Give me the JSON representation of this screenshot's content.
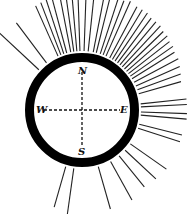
{
  "diagram": {
    "center": [
      82,
      110
    ],
    "ring_outer_r": 57,
    "ring_inner_r": 48,
    "ray_start_r": 59,
    "ray_color": "#222222",
    "ring_color": "#000000",
    "labels": {
      "north": "N",
      "south": "S",
      "east": "E",
      "west": "W"
    },
    "rays": [
      {
        "angle": -47,
        "len": 60
      },
      {
        "angle": -37,
        "len": 50
      },
      {
        "angle": -24,
        "len": 55
      },
      {
        "angle": -21,
        "len": 56
      },
      {
        "angle": -18,
        "len": 58
      },
      {
        "angle": -15,
        "len": 58
      },
      {
        "angle": -11,
        "len": 60
      },
      {
        "angle": -8,
        "len": 60
      },
      {
        "angle": -5,
        "len": 60
      },
      {
        "angle": -2,
        "len": 62
      },
      {
        "angle": 2,
        "len": 62
      },
      {
        "angle": 6,
        "len": 60
      },
      {
        "angle": 11,
        "len": 58
      },
      {
        "angle": 14,
        "len": 60
      },
      {
        "angle": 18,
        "len": 60
      },
      {
        "angle": 21,
        "len": 58
      },
      {
        "angle": 24,
        "len": 60
      },
      {
        "angle": 28,
        "len": 58
      },
      {
        "angle": 31,
        "len": 58
      },
      {
        "angle": 34,
        "len": 58
      },
      {
        "angle": 37,
        "len": 56
      },
      {
        "angle": 40,
        "len": 56
      },
      {
        "angle": 43,
        "len": 56
      },
      {
        "angle": 46,
        "len": 54
      },
      {
        "angle": 49,
        "len": 54
      },
      {
        "angle": 52,
        "len": 52
      },
      {
        "angle": 55,
        "len": 52
      },
      {
        "angle": 58,
        "len": 50
      },
      {
        "angle": 62,
        "len": 50
      },
      {
        "angle": 66,
        "len": 48
      },
      {
        "angle": 70,
        "len": 46
      },
      {
        "angle": 74,
        "len": 44
      },
      {
        "angle": 84,
        "len": 46
      },
      {
        "angle": 87,
        "len": 46
      },
      {
        "angle": 92,
        "len": 46
      },
      {
        "angle": 95,
        "len": 46
      },
      {
        "angle": 104,
        "len": 44
      },
      {
        "angle": 108,
        "len": 44
      },
      {
        "angle": 125,
        "len": 44
      },
      {
        "angle": 133,
        "len": 42
      },
      {
        "angle": 141,
        "len": 40
      },
      {
        "angle": 151,
        "len": 44
      },
      {
        "angle": 164,
        "len": 44
      },
      {
        "angle": 188,
        "len": 46
      },
      {
        "angle": 196,
        "len": 42
      }
    ]
  }
}
